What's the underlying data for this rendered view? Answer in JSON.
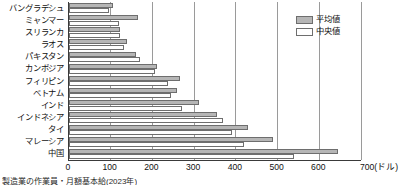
{
  "chart_data": {
    "type": "bar",
    "orientation": "horizontal",
    "title": "",
    "xlabel": "700(ドル)",
    "ylabel": "",
    "xlim": [
      0,
      700
    ],
    "xticks": [
      0,
      100,
      200,
      300,
      400,
      500,
      600,
      700
    ],
    "xtick_labels": [
      "0",
      "100",
      "200",
      "300",
      "400",
      "500",
      "600",
      "700"
    ],
    "unit_label": "700(ドル)",
    "grid": true,
    "grid_axis": "x",
    "legend_position": "top-right",
    "categories": [
      "バングラデシュ",
      "ミャンマー",
      "スリランカ",
      "ラオス",
      "パキスタン",
      "カンボジア",
      "フィリピン",
      "ベトナム",
      "インド",
      "インドネシア",
      "タイ",
      "マレーシア",
      "中国"
    ],
    "series": [
      {
        "name": "平均値",
        "color": "#b6b6b6",
        "values": [
          105,
          165,
          122,
          140,
          160,
          210,
          265,
          260,
          312,
          355,
          430,
          490,
          645
        ]
      },
      {
        "name": "中央値",
        "color": "#ffffff",
        "values": [
          95,
          120,
          122,
          132,
          170,
          205,
          238,
          245,
          270,
          370,
          390,
          420,
          540
        ]
      }
    ]
  },
  "legend": {
    "items": [
      {
        "label": "平均値",
        "swatch": "mean"
      },
      {
        "label": "中央値",
        "swatch": "median"
      }
    ]
  },
  "footnote": {
    "text": "製造業の作業員・月額基本給(2023年)"
  }
}
